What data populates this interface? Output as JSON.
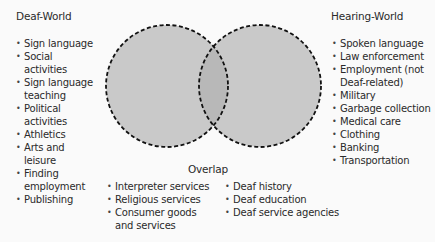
{
  "diagram": {
    "type": "venn",
    "circle_fill": "#c9c9c9",
    "overlap_fill": "#b8b8b8",
    "stroke": "#111111",
    "left": {
      "title": "Deaf-World",
      "items": [
        "Sign language",
        "Social activities",
        "Sign language teaching",
        "Political activities",
        "Athletics",
        "Arts and leisure",
        "Finding employment",
        "Publishing"
      ]
    },
    "right": {
      "title": "Hearing-World",
      "items": [
        "Spoken language",
        "Law enforcement",
        "Employment (not Deaf-related)",
        "Military",
        "Garbage collection",
        "Medical care",
        "Clothing",
        "Banking",
        "Transportation"
      ]
    },
    "overlap": {
      "title": "Overlap",
      "col1": [
        "Interpreter services",
        "Religious services",
        "Consumer goods and services"
      ],
      "col2": [
        "Deaf history",
        "Deaf education",
        "Deaf service agencies"
      ]
    }
  }
}
